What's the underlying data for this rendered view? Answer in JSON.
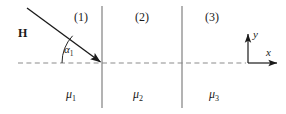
{
  "figure": {
    "width": 286,
    "height": 114,
    "background": "#ffffff",
    "line_color": "#4d4d4d",
    "dash_color": "#8c8c8c",
    "text_color": "#1a1a1a",
    "arrow_color": "#1a1a1a"
  },
  "field": {
    "vector_label": "H",
    "angle_label": "α",
    "angle_subscript": "1"
  },
  "regions": [
    {
      "label": "(1)",
      "permeability": "μ",
      "subscript": "1"
    },
    {
      "label": "(2)",
      "permeability": "μ",
      "subscript": "2"
    },
    {
      "label": "(3)",
      "permeability": "μ",
      "subscript": "3"
    }
  ],
  "axes": {
    "x_label": "x",
    "y_label": "y"
  },
  "geometry": {
    "interface_x_positions": [
      102,
      182
    ],
    "baseline_y": 63,
    "incident_ray_start": [
      27,
      8
    ],
    "incident_ray_end": [
      102,
      63
    ],
    "origin": [
      248,
      63
    ]
  }
}
